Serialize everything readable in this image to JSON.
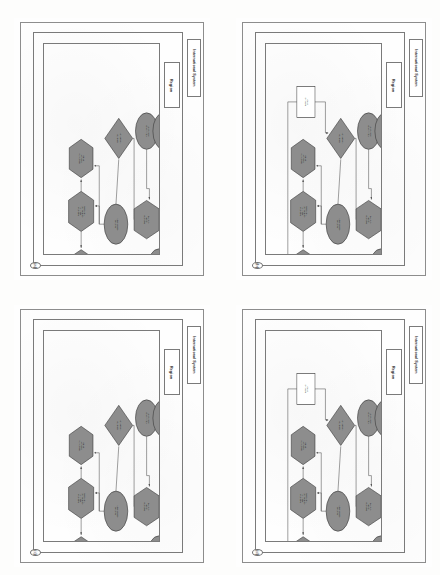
{
  "figure": {
    "type": "multi-panel-flowchart-scan",
    "orientation": "landscape-rotated-90ccw",
    "panel_count": 4,
    "grid": "2x2"
  },
  "labels": {
    "international_system": "International System",
    "region": "Region"
  },
  "colors": {
    "node_fill": "#8d8d8d",
    "node_stroke": "#333333",
    "white_node_fill": "#ffffff",
    "connector": "#555555",
    "frame": "#7a7a7a",
    "page_background": "#fefefe"
  },
  "panels": [
    {
      "letter": "(a)",
      "caption": "",
      "has_white_node": false,
      "nodes": [
        {
          "id": "n1",
          "shape": "hexagon",
          "label": "Rise of new regional power"
        },
        {
          "id": "n2",
          "shape": "hexagon",
          "label": "Regional security competition intensifies"
        },
        {
          "id": "n3",
          "shape": "hexagon",
          "label": "Balancing coalition forms"
        },
        {
          "id": "n4",
          "shape": "ellipse",
          "label": "Alliance commitment"
        },
        {
          "id": "n5",
          "shape": "diamond",
          "label": "External intervention"
        },
        {
          "id": "n6",
          "shape": "hexagon",
          "label": "Regional order change"
        },
        {
          "id": "n7",
          "shape": "ellipse",
          "label": "Great power restraint and local autonomy"
        },
        {
          "id": "n8",
          "shape": "ellipse",
          "label": "Institutional adaptation"
        },
        {
          "id": "n9",
          "shape": "ellipse",
          "label": "Stable regional balance"
        }
      ],
      "edges": [
        {
          "from": "n2",
          "to": "n1"
        },
        {
          "from": "n2",
          "to": "n3"
        },
        {
          "from": "n4",
          "to": "n2"
        },
        {
          "from": "n5",
          "to": "n3"
        },
        {
          "from": "n4",
          "to": "n5"
        },
        {
          "from": "n5",
          "to": "n6"
        },
        {
          "from": "n6",
          "to": "n7"
        },
        {
          "from": "n1",
          "to": "n7"
        },
        {
          "from": "n8",
          "to": "n6"
        },
        {
          "from": "n9",
          "to": "n8"
        }
      ]
    },
    {
      "letter": "(b)",
      "caption": "",
      "has_white_node": true,
      "nodes": [
        {
          "id": "n1",
          "shape": "hexagon",
          "label": "Rise of new regional power"
        },
        {
          "id": "n2",
          "shape": "hexagon",
          "label": "Regional security competition intensifies"
        },
        {
          "id": "n3",
          "shape": "hexagon",
          "label": "Balancing coalition forms"
        },
        {
          "id": "n4",
          "shape": "ellipse",
          "label": "Alliance commitment"
        },
        {
          "id": "n5",
          "shape": "diamond",
          "label": "External intervention"
        },
        {
          "id": "n6",
          "shape": "hexagon",
          "label": "Regional order change"
        },
        {
          "id": "n7",
          "shape": "ellipse",
          "label": "Great power restraint and local autonomy"
        },
        {
          "id": "n8",
          "shape": "ellipse",
          "label": "Institutional adaptation"
        },
        {
          "id": "n9",
          "shape": "ellipse",
          "label": "Stable regional balance"
        },
        {
          "id": "n10",
          "shape": "rectangle",
          "label": "External shock",
          "fill": "white"
        }
      ],
      "edges": [
        {
          "from": "n2",
          "to": "n1"
        },
        {
          "from": "n2",
          "to": "n3"
        },
        {
          "from": "n4",
          "to": "n2"
        },
        {
          "from": "n5",
          "to": "n3"
        },
        {
          "from": "n4",
          "to": "n5"
        },
        {
          "from": "n5",
          "to": "n6"
        },
        {
          "from": "n6",
          "to": "n7"
        },
        {
          "from": "n1",
          "to": "n7"
        },
        {
          "from": "n8",
          "to": "n6"
        },
        {
          "from": "n9",
          "to": "n8"
        },
        {
          "from": "n10",
          "to": "n5"
        },
        {
          "from": "n10",
          "to": "n1"
        }
      ]
    },
    {
      "letter": "(c)",
      "caption": "",
      "has_white_node": false,
      "nodes": [
        {
          "id": "n1",
          "shape": "hexagon",
          "label": "Rise of new regional power"
        },
        {
          "id": "n2",
          "shape": "hexagon",
          "label": "Regional security competition intensifies"
        },
        {
          "id": "n3",
          "shape": "hexagon",
          "label": "Balancing coalition forms"
        },
        {
          "id": "n4",
          "shape": "ellipse",
          "label": "Alliance commitment"
        },
        {
          "id": "n5",
          "shape": "diamond",
          "label": "External intervention"
        },
        {
          "id": "n6",
          "shape": "hexagon",
          "label": "Regional order change"
        },
        {
          "id": "n7",
          "shape": "ellipse",
          "label": "Great power restraint and local autonomy"
        },
        {
          "id": "n8",
          "shape": "ellipse",
          "label": "Institutional adaptation"
        },
        {
          "id": "n9",
          "shape": "ellipse",
          "label": "Stable regional balance"
        }
      ],
      "edges": [
        {
          "from": "n2",
          "to": "n1"
        },
        {
          "from": "n2",
          "to": "n3"
        },
        {
          "from": "n4",
          "to": "n2"
        },
        {
          "from": "n5",
          "to": "n3"
        },
        {
          "from": "n4",
          "to": "n5"
        },
        {
          "from": "n5",
          "to": "n6"
        },
        {
          "from": "n6",
          "to": "n7"
        },
        {
          "from": "n1",
          "to": "n7"
        },
        {
          "from": "n8",
          "to": "n6"
        },
        {
          "from": "n9",
          "to": "n8"
        }
      ]
    },
    {
      "letter": "(d)",
      "caption": "",
      "has_white_node": true,
      "nodes": [
        {
          "id": "n1",
          "shape": "hexagon",
          "label": "Rise of new regional power"
        },
        {
          "id": "n2",
          "shape": "hexagon",
          "label": "Regional security competition intensifies"
        },
        {
          "id": "n3",
          "shape": "hexagon",
          "label": "Balancing coalition forms"
        },
        {
          "id": "n4",
          "shape": "ellipse",
          "label": "Alliance commitment"
        },
        {
          "id": "n5",
          "shape": "diamond",
          "label": "External intervention"
        },
        {
          "id": "n6",
          "shape": "hexagon",
          "label": "Regional order change"
        },
        {
          "id": "n7",
          "shape": "ellipse",
          "label": "Great power restraint and local autonomy"
        },
        {
          "id": "n8",
          "shape": "ellipse",
          "label": "Institutional adaptation"
        },
        {
          "id": "n9",
          "shape": "ellipse",
          "label": "Stable regional balance"
        },
        {
          "id": "n10",
          "shape": "rectangle",
          "label": "External shock",
          "fill": "white"
        }
      ],
      "edges": [
        {
          "from": "n2",
          "to": "n1"
        },
        {
          "from": "n2",
          "to": "n3"
        },
        {
          "from": "n4",
          "to": "n2"
        },
        {
          "from": "n5",
          "to": "n3"
        },
        {
          "from": "n4",
          "to": "n5"
        },
        {
          "from": "n5",
          "to": "n6"
        },
        {
          "from": "n6",
          "to": "n7"
        },
        {
          "from": "n1",
          "to": "n7"
        },
        {
          "from": "n8",
          "to": "n6"
        },
        {
          "from": "n9",
          "to": "n8"
        },
        {
          "from": "n10",
          "to": "n5"
        },
        {
          "from": "n10",
          "to": "n1"
        }
      ]
    }
  ]
}
